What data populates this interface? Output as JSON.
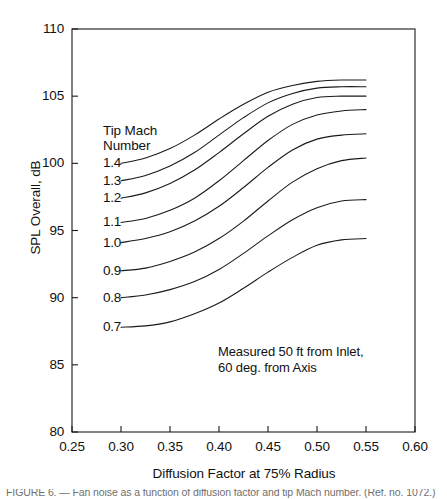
{
  "chart_data": {
    "type": "line",
    "title": "",
    "xlabel": "Diffusion Factor at 75% Radius",
    "ylabel": "SPL Overall, dB",
    "xlim": [
      0.25,
      0.6
    ],
    "ylim": [
      80,
      110
    ],
    "xticks": [
      "0.25",
      "0.30",
      "0.35",
      "0.40",
      "0.45",
      "0.50",
      "0.55",
      "0.60"
    ],
    "yticks": [
      "110",
      "105",
      "100",
      "95",
      "90",
      "85",
      "80"
    ],
    "grid": false,
    "legend_position": "inline-left-of-curves",
    "legend_title_line1": "Tip Mach",
    "legend_title_line2": "Number",
    "annotation_line1": "Measured 50 ft from Inlet,",
    "annotation_line2": "60 deg. from Axis",
    "x": [
      0.3,
      0.325,
      0.35,
      0.375,
      0.4,
      0.425,
      0.45,
      0.475,
      0.5,
      0.525,
      0.55
    ],
    "series": [
      {
        "name": "1.4",
        "values": [
          100.0,
          100.4,
          101.1,
          102.1,
          103.3,
          104.4,
          105.3,
          105.8,
          106.1,
          106.2,
          106.2
        ]
      },
      {
        "name": "1.3",
        "values": [
          98.7,
          99.1,
          99.8,
          100.8,
          102.1,
          103.4,
          104.5,
          105.2,
          105.6,
          105.7,
          105.7
        ]
      },
      {
        "name": "1.2",
        "values": [
          97.4,
          97.8,
          98.5,
          99.5,
          100.8,
          102.2,
          103.5,
          104.4,
          104.9,
          105.0,
          105.0
        ]
      },
      {
        "name": "1.1",
        "values": [
          95.6,
          95.9,
          96.5,
          97.4,
          98.7,
          100.2,
          101.7,
          102.9,
          103.6,
          103.9,
          104.0
        ]
      },
      {
        "name": "1.0",
        "values": [
          94.1,
          94.4,
          94.9,
          95.7,
          96.8,
          98.2,
          99.7,
          101.0,
          101.8,
          102.1,
          102.2
        ]
      },
      {
        "name": "0.9",
        "values": [
          92.0,
          92.2,
          92.7,
          93.4,
          94.4,
          95.7,
          97.2,
          98.6,
          99.6,
          100.2,
          100.4
        ]
      },
      {
        "name": "0.8",
        "values": [
          90.0,
          90.2,
          90.6,
          91.2,
          92.1,
          93.3,
          94.6,
          95.8,
          96.7,
          97.2,
          97.3
        ]
      },
      {
        "name": "0.7",
        "values": [
          87.8,
          87.9,
          88.2,
          88.8,
          89.6,
          90.7,
          91.9,
          93.0,
          93.9,
          94.3,
          94.4
        ]
      }
    ],
    "series_label_positions_db": [
      100.0,
      98.7,
      97.4,
      95.6,
      94.1,
      92.0,
      90.0,
      87.8
    ],
    "line_color": "#1a1a1a",
    "frame_color": "#1a1a1a",
    "background_color": "#ffffff"
  },
  "caption": {
    "text": "truncated figure caption below plot"
  }
}
